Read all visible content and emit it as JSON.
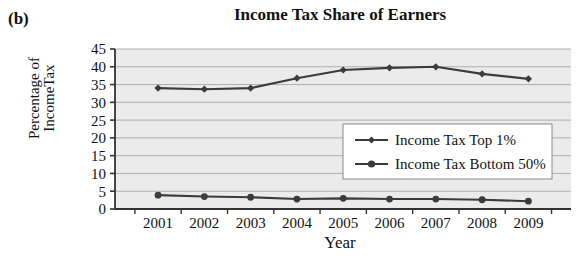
{
  "panel": {
    "label": "(b)"
  },
  "chart_data": {
    "type": "line",
    "title": "Income Tax Share of Earners",
    "xlabel": "Year",
    "ylabel": "Percentage of\nIncomeTax",
    "categories": [
      "2001",
      "2002",
      "2003",
      "2004",
      "2005",
      "2006",
      "2007",
      "2008",
      "2009"
    ],
    "x": [
      2001,
      2002,
      2003,
      2004,
      2005,
      2006,
      2007,
      2008,
      2009
    ],
    "ylim": [
      0,
      45
    ],
    "yticks": [
      0,
      5,
      10,
      15,
      20,
      25,
      30,
      35,
      40,
      45
    ],
    "ytick_labels": [
      "0",
      "5",
      "10",
      "15",
      "20",
      "25",
      "30",
      "35",
      "40",
      "45"
    ],
    "grid": true,
    "grid_axis": "y",
    "legend_position": "center-right",
    "series": [
      {
        "name": "Income Tax Top 1%",
        "marker": "diamond",
        "color": "#3b3b3b",
        "values": [
          34.0,
          33.7,
          34.0,
          36.8,
          39.1,
          39.7,
          40.0,
          38.0,
          36.6
        ]
      },
      {
        "name": "Income Tax Bottom 50%",
        "marker": "circle",
        "color": "#3b3b3b",
        "values": [
          3.9,
          3.5,
          3.3,
          2.8,
          3.0,
          2.8,
          2.8,
          2.6,
          2.2
        ]
      }
    ],
    "legend": [
      "Income Tax Top 1%",
      "Income Tax Bottom 50%"
    ],
    "colors": {
      "line": "#3b3b3b",
      "plot_background": "#ebebeb",
      "gridline": "#a8a8a8",
      "axis": "#333333",
      "legend_background": "#ffffff",
      "legend_border": "#8a8a8a"
    }
  }
}
